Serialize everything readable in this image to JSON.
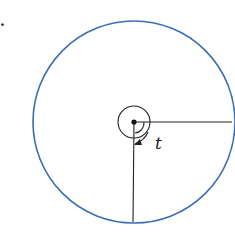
{
  "diagram": {
    "label_t": "t",
    "corner_mark": ".",
    "colors": {
      "circle": "#3a6db5",
      "lines": "#222222",
      "background": "#ffffff"
    }
  }
}
